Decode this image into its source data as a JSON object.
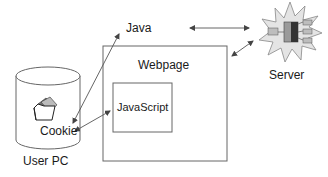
{
  "diagram": {
    "nodes": {
      "user_pc": {
        "label": "User PC",
        "shape": "cylinder"
      },
      "cookie": {
        "label": "Cookie",
        "icon": "folder-icon"
      },
      "java": {
        "label": "Java"
      },
      "webpage": {
        "label": "Webpage",
        "shape": "rectangle"
      },
      "javascript": {
        "label": "JavaScript",
        "shape": "rectangle"
      },
      "server": {
        "label": "Server",
        "icon": "server-starburst-icon"
      }
    },
    "edges": [
      {
        "from": "cookie",
        "to": "java",
        "type": "arrow"
      },
      {
        "from": "cookie",
        "to": "javascript",
        "type": "bidirectional-arrow"
      },
      {
        "from": "java",
        "to": "server",
        "type": "bidirectional-arrow"
      },
      {
        "from": "server",
        "to": "webpage",
        "type": "bidirectional-arrow"
      }
    ],
    "colors": {
      "stroke": "#555555",
      "text": "#1a1a1a",
      "server_burst": "#d9d9d9",
      "server_box": "#8a8a8a"
    }
  }
}
